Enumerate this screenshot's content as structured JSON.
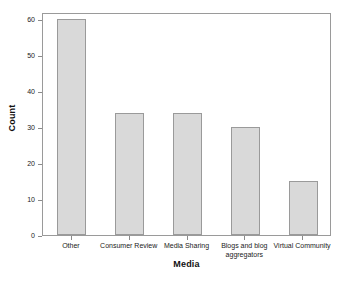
{
  "chart_data": {
    "type": "bar",
    "title": "",
    "xlabel": "Media",
    "ylabel": "Count",
    "categories": [
      "Other",
      "Consumer Review",
      "Media Sharing",
      "Blogs and blog aggregators",
      "Virtual Community"
    ],
    "values": [
      60,
      34,
      34,
      30,
      15
    ],
    "ylim": [
      0,
      62
    ],
    "yticks": [
      0,
      10,
      20,
      30,
      40,
      50,
      60
    ],
    "ytick_labels": [
      "0",
      "10",
      "20",
      "30",
      "40",
      "50",
      "60"
    ],
    "grid": false,
    "legend": false,
    "bar_fill_color": "#d9d9d9",
    "bar_border_color": "#9a9a9a",
    "axis_color": "#9a9a9a",
    "background_color": "#ffffff"
  },
  "axes": {
    "y_title": "Count",
    "x_title": "Media"
  }
}
